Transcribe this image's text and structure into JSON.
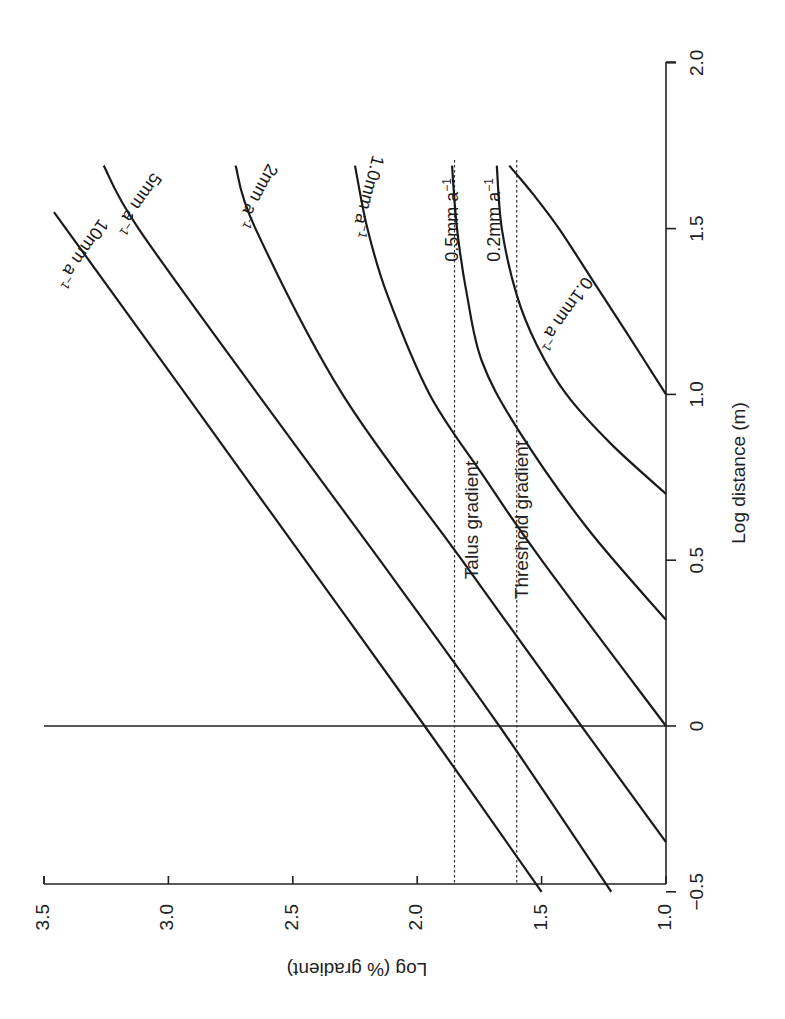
{
  "chart_data": {
    "type": "line",
    "orientation_note": "figure printed rotated 90 degrees counter-clockwise",
    "xlabel": "Log distance (m)",
    "ylabel": "Log (% gradient)",
    "xlim": [
      -0.5,
      2.0
    ],
    "ylim": [
      1.0,
      3.5
    ],
    "x_ticks": [
      "-0.5",
      "0",
      "0.5",
      "1.0",
      "1.5",
      "2.0"
    ],
    "y_ticks": [
      "1.0",
      "1.5",
      "2.0",
      "2.5",
      "3.0",
      "3.5"
    ],
    "grid": false,
    "reference_lines": [
      {
        "name": "Talus gradient",
        "axis": "y",
        "value": 1.85,
        "style": "dotted"
      },
      {
        "name": "Threshold gradient",
        "axis": "y",
        "value": 1.6,
        "style": "dotted"
      },
      {
        "name": "zero distance",
        "axis": "x",
        "value": 0,
        "style": "solid"
      }
    ],
    "series": [
      {
        "name": "10mm a⁻¹",
        "label": "10mm a",
        "x": [
          -0.5,
          0.0,
          0.5,
          1.0,
          1.55
        ],
        "y": [
          1.5,
          1.97,
          2.45,
          2.93,
          3.46
        ]
      },
      {
        "name": "5mm a⁻¹",
        "label": "5mm a",
        "x": [
          -0.5,
          0.0,
          0.5,
          1.0,
          1.5,
          1.69
        ],
        "y": [
          1.22,
          1.67,
          2.15,
          2.64,
          3.12,
          3.26
        ]
      },
      {
        "name": "2mm a⁻¹",
        "label": "2mm a",
        "x": [
          -0.35,
          0.0,
          0.5,
          1.0,
          1.5,
          1.69
        ],
        "y": [
          1.0,
          1.34,
          1.82,
          2.3,
          2.65,
          2.73
        ]
      },
      {
        "name": "1.0mm a⁻¹",
        "label": "1.0mm a",
        "x": [
          0.0,
          0.5,
          0.75,
          1.0,
          1.3,
          1.5,
          1.69
        ],
        "y": [
          1.0,
          1.5,
          1.73,
          1.95,
          2.12,
          2.2,
          2.25
        ]
      },
      {
        "name": "0.5mm a⁻¹",
        "label": "0.5mm a",
        "x": [
          0.32,
          0.6,
          0.9,
          1.1,
          1.3,
          1.5,
          1.69
        ],
        "y": [
          1.0,
          1.32,
          1.6,
          1.74,
          1.8,
          1.84,
          1.86
        ]
      },
      {
        "name": "0.2mm a⁻¹",
        "label": "0.2mm a",
        "x": [
          0.7,
          0.85,
          1.0,
          1.15,
          1.3,
          1.5,
          1.69
        ],
        "y": [
          1.0,
          1.22,
          1.4,
          1.52,
          1.6,
          1.66,
          1.68
        ]
      },
      {
        "name": "0.1mm a⁻¹",
        "label": "0.1mm a",
        "x": [
          1.0,
          1.2,
          1.35,
          1.5,
          1.6,
          1.69
        ],
        "y": [
          1.0,
          1.17,
          1.3,
          1.43,
          1.53,
          1.63
        ]
      }
    ]
  },
  "labels": {
    "x_axis_title": "Log distance (m)",
    "y_axis_title": "Log (% gradient)",
    "talus": "Talus gradient",
    "threshold": "Threshold gradient",
    "superscript": "−1",
    "x_ticks": [
      "−0.5",
      "0",
      "0.5",
      "1.0",
      "1.5",
      "2.0"
    ],
    "y_ticks": [
      "1.0",
      "1.5",
      "2.0",
      "2.5",
      "3.0",
      "3.5"
    ],
    "curves": [
      "10mm a",
      "5mm a",
      "2mm a",
      "1.0mm a",
      "0.5mm a",
      "0.2mm a",
      "0.1mm a"
    ]
  }
}
